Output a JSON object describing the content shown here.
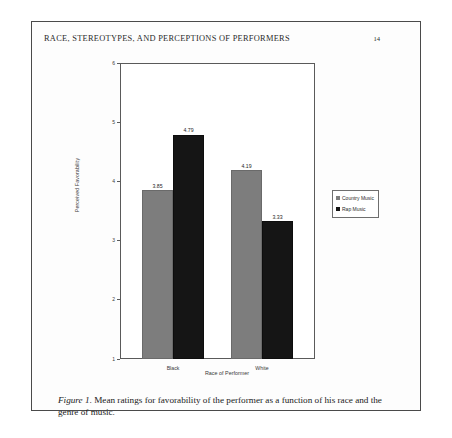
{
  "document": {
    "running_head": "RACE, STEREOTYPES, AND PERCEPTIONS OF PERFORMERS",
    "page_number": "14",
    "caption_label": "Figure 1",
    "caption_text": ". Mean ratings for favorability of the performer as a function of his race and the genre of music."
  },
  "chart_data": {
    "type": "bar",
    "title": "",
    "categories": [
      "Black",
      "White"
    ],
    "series": [
      {
        "name": "Country Music",
        "values": [
          3.85,
          4.19
        ],
        "color": "#7d7d7d"
      },
      {
        "name": "Rap Music",
        "values": [
          4.79,
          3.33
        ],
        "color": "#151515"
      }
    ],
    "xlabel": "Race of Performer",
    "ylabel": "Perceived Favorability",
    "ylim": [
      1,
      6
    ],
    "yticks": [
      "6",
      "5",
      "4",
      "3",
      "2",
      "1"
    ],
    "grid": false,
    "legend_position": "right",
    "data_labels": [
      "3.85",
      "4.79",
      "4.19",
      "3.33"
    ]
  }
}
